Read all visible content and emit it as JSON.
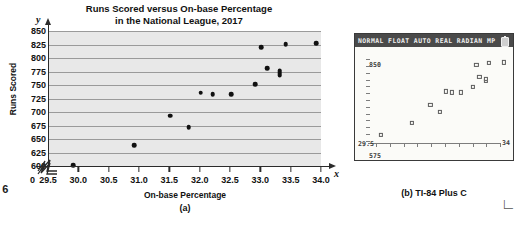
{
  "figure_number": "e 6",
  "panel_a": {
    "title_line1": "Runs Scored versus On-base Percentage",
    "title_line2": "in the National League, 2017",
    "x_axis_title": "On-base Percentage",
    "y_axis_title": "Runs Scored",
    "x_variable": "x",
    "y_variable": "y",
    "origin_label": "0",
    "caption": "(a)"
  },
  "panel_b": {
    "status_bar": "NORMAL FLOAT AUTO REAL RADIAN MP",
    "battery_icon": "battery-icon",
    "window_ymax": "850",
    "window_ymin": "575",
    "window_xmin": "29.5",
    "window_xmax": "34",
    "caption": "(b) TI-84 Plus C"
  },
  "chart_data": {
    "type": "scatter",
    "title": "Runs Scored versus On-base Percentage in the National League, 2017",
    "xlabel": "On-base Percentage",
    "ylabel": "Runs Scored",
    "xlim": [
      29.5,
      34.0
    ],
    "ylim": [
      600,
      850
    ],
    "grid": true,
    "grid_axis": "y",
    "axis_break": true,
    "legend": null,
    "x_ticks": [
      "29.5",
      "30.0",
      "30.5",
      "31.0",
      "31.5",
      "32.0",
      "32.5",
      "33.0",
      "33.5",
      "34.0"
    ],
    "x_tick_values": [
      29.5,
      30.0,
      30.5,
      31.0,
      31.5,
      32.0,
      32.5,
      33.0,
      33.5,
      34.0
    ],
    "y_ticks": [
      "600",
      "625",
      "650",
      "675",
      "700",
      "725",
      "750",
      "775",
      "800",
      "825",
      "850"
    ],
    "y_tick_values": [
      600,
      625,
      650,
      675,
      700,
      725,
      750,
      775,
      800,
      825,
      850
    ],
    "points": [
      {
        "x": 29.9,
        "y": 601
      },
      {
        "x": 30.9,
        "y": 639
      },
      {
        "x": 31.5,
        "y": 693
      },
      {
        "x": 31.8,
        "y": 672
      },
      {
        "x": 32.0,
        "y": 736
      },
      {
        "x": 32.2,
        "y": 733
      },
      {
        "x": 32.5,
        "y": 733
      },
      {
        "x": 32.9,
        "y": 751
      },
      {
        "x": 33.0,
        "y": 820
      },
      {
        "x": 33.1,
        "y": 781
      },
      {
        "x": 33.3,
        "y": 770
      },
      {
        "x": 33.3,
        "y": 775
      },
      {
        "x": 33.4,
        "y": 826
      },
      {
        "x": 33.9,
        "y": 827
      }
    ]
  },
  "calc_chart_data": {
    "type": "scatter",
    "xlim": [
      29.5,
      34
    ],
    "ylim": [
      575,
      850
    ],
    "marker": "square",
    "points": [
      {
        "x": 29.9,
        "y": 601
      },
      {
        "x": 30.9,
        "y": 639
      },
      {
        "x": 31.5,
        "y": 693
      },
      {
        "x": 31.8,
        "y": 672
      },
      {
        "x": 32.0,
        "y": 736
      },
      {
        "x": 32.2,
        "y": 733
      },
      {
        "x": 32.5,
        "y": 733
      },
      {
        "x": 32.9,
        "y": 751
      },
      {
        "x": 33.0,
        "y": 820
      },
      {
        "x": 33.1,
        "y": 781
      },
      {
        "x": 33.3,
        "y": 770
      },
      {
        "x": 33.3,
        "y": 775
      },
      {
        "x": 33.4,
        "y": 826
      },
      {
        "x": 33.9,
        "y": 827
      }
    ]
  }
}
